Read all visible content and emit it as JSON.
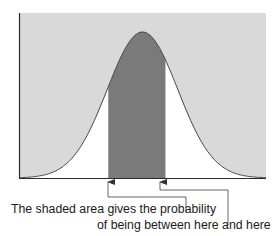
{
  "chart_data": {
    "type": "area",
    "title": "",
    "xlabel": "",
    "ylabel": "",
    "curve": {
      "distribution": "normal",
      "mean": 0,
      "sd": 1
    },
    "x_range": [
      -3.5,
      3.5
    ],
    "shaded_interval": [
      -0.97,
      0.65
    ],
    "grid": false,
    "legend": null,
    "ticks": {
      "x": [],
      "y": []
    },
    "colors": {
      "above_curve": "#d9d9d9",
      "under_curve": "#ffffff",
      "shaded_area": "#7a7a7a",
      "axes": "#2a2a2a",
      "curve": "#444444"
    }
  },
  "annotation": {
    "line1": "The shaded area gives the probability",
    "line2": "of being between here and here"
  },
  "arrows": [
    {
      "label": "lower bound arrow",
      "points_to": "left edge of shaded area"
    },
    {
      "label": "upper bound arrow",
      "points_to": "right edge of shaded area"
    }
  ]
}
